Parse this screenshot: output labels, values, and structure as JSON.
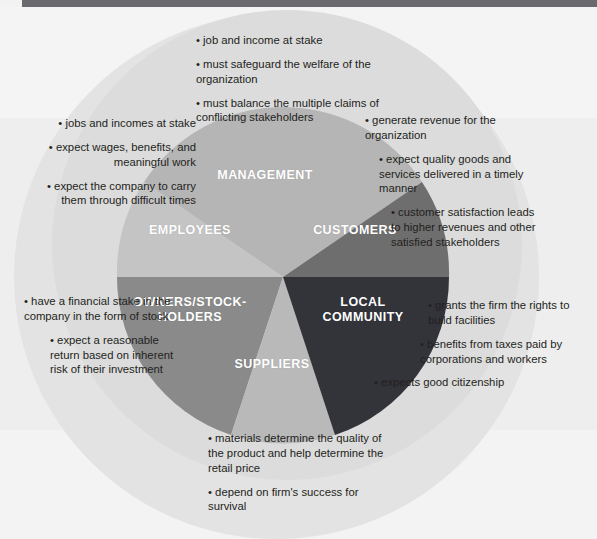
{
  "diagram": {
    "type": "six-segment radial stakeholder diagram",
    "colors": {
      "page_background": "#f2f2f2",
      "outer_ring": "#e3e3e3",
      "outer_ring_inner": "#dcdcdc",
      "top_rule": "#6a6a6e",
      "management": "#b5b5b5",
      "employees": "#c4c4c4",
      "customers": "#6e6e6e",
      "owners": "#8a8a8a",
      "suppliers": "#b9b9b9",
      "local_community": "#33333a",
      "label_text": "#ffffff",
      "body_text": "#231f20"
    },
    "segments": [
      {
        "id": "management",
        "label": "MANAGEMENT",
        "color": "#b5b5b5",
        "bullets": [
          "job and income at stake",
          "must safeguard the welfare of the organization",
          "must balance the multiple claims of conflicting stakeholders"
        ]
      },
      {
        "id": "employees",
        "label": "EMPLOYEES",
        "color": "#c4c4c4",
        "bullets": [
          "jobs and incomes at stake",
          "expect wages, benefits, and meaningful work",
          "expect the company to carry them through difficult times"
        ]
      },
      {
        "id": "customers",
        "label": "CUSTOMERS",
        "color": "#6e6e6e",
        "bullets": [
          "generate revenue for the organization",
          "expect quality goods and services delivered in a timely manner",
          "customer satisfaction leads to higher revenues and other satisfied stakeholders"
        ]
      },
      {
        "id": "owners",
        "label": "OWNERS/STOCK-\nHOLDERS",
        "color": "#8a8a8a",
        "bullets": [
          "have a financial stake in the company in the form of stock",
          "expect a reasonable return based on inherent risk of their investment"
        ]
      },
      {
        "id": "suppliers",
        "label": "SUPPLIERS",
        "color": "#b9b9b9",
        "bullets": [
          "materials determine the quality of the product and help determine the retail price",
          "depend on firm's success for survival"
        ]
      },
      {
        "id": "local-community",
        "label": "LOCAL\nCOMMUNITY",
        "color": "#33333a",
        "bullets": [
          "grants the firm the rights to build facilities",
          "benefits from taxes paid by corporations and workers",
          "expects good citizenship"
        ]
      }
    ]
  },
  "text": {
    "management": {
      "b1": "job and income at stake",
      "b2": "must safeguard the welfare of the organization",
      "b3": "must balance the multiple claims of conflicting stakeholders"
    },
    "employees": {
      "b1": "jobs and incomes at stake",
      "b2": "expect wages, benefits, and meaningful work",
      "b3": "expect the company to carry them through difficult times"
    },
    "customers": {
      "b1": "generate revenue for the organization",
      "b2": "expect quality goods and services delivered in a timely manner",
      "b3": "customer satisfaction leads to higher revenues and other satisfied stakeholders"
    },
    "owners": {
      "b1": "have a financial stake in the company in the form of stock",
      "b2": "expect a reasonable return based on inherent risk of their investment"
    },
    "suppliers": {
      "b1": "materials determine the quality of the product and help determine the retail price",
      "b2": "depend on firm's success for survival"
    },
    "community": {
      "b1": "grants the firm the rights to build facilities",
      "b2": "benefits from taxes paid by corporations and workers",
      "b3": "expects good citizenship"
    }
  },
  "labels": {
    "management": "MANAGEMENT",
    "employees": "EMPLOYEES",
    "customers": "CUSTOMERS",
    "owners": "OWNERS/STOCK-\nHOLDERS",
    "suppliers": "SUPPLIERS",
    "community": "LOCAL\nCOMMUNITY"
  }
}
